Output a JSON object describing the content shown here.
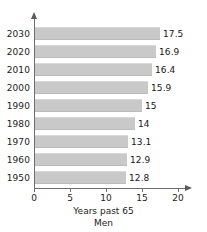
{
  "chart_data": {
    "type": "bar",
    "orientation": "horizontal",
    "title": "",
    "subtitle": "Men",
    "xlabel": "Years past 65",
    "ylabel": "",
    "categories": [
      "2030",
      "2020",
      "2010",
      "2000",
      "1990",
      "1980",
      "1970",
      "1960",
      "1950"
    ],
    "values": [
      17.5,
      16.9,
      16.4,
      15.9,
      15,
      14,
      13.1,
      12.9,
      12.8
    ],
    "value_labels": [
      "17.5",
      "16.9",
      "16.4",
      "15.9",
      "15",
      "14",
      "13.1",
      "12.9",
      "12.8"
    ],
    "xlim": [
      0,
      20
    ],
    "xticks": [
      0,
      5,
      10,
      15,
      20
    ],
    "xtick_labels": [
      "0",
      "5",
      "10",
      "15",
      "20"
    ],
    "grid": false,
    "legend": false,
    "bar_color": "#c9c9c9",
    "axis_color": "#6e6e6e",
    "text_color": "#1a1a1a",
    "background": "#ffffff"
  }
}
